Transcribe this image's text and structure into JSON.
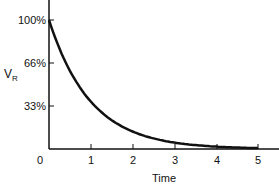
{
  "chart_data": {
    "type": "line",
    "title": "",
    "xlabel": "Time",
    "ylabel": "V_R",
    "x_ticks": [
      "0",
      "1",
      "2",
      "3",
      "4",
      "5"
    ],
    "y_ticks": [
      "33%",
      "66%",
      "100%"
    ],
    "xlim": [
      0,
      5.5
    ],
    "ylim": [
      0,
      115
    ],
    "grid": false,
    "legend": "none",
    "series": [
      {
        "name": "V_R",
        "x": [
          0,
          0.5,
          1,
          1.5,
          2,
          2.5,
          3,
          3.5,
          4,
          4.5,
          5
        ],
        "values": [
          100,
          61,
          37,
          22,
          14,
          8,
          5,
          3,
          2,
          1,
          0.7
        ]
      }
    ]
  },
  "labels": {
    "y100": "100%",
    "y66": "66%",
    "y33": "33%",
    "ylabel_main": "V",
    "ylabel_sub": "R",
    "x0": "0",
    "x1": "1",
    "x2": "2",
    "x3": "3",
    "x4": "4",
    "x5": "5",
    "xlabel": "Time"
  }
}
